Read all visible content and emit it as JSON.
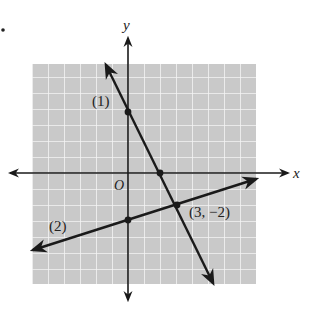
{
  "figure": {
    "marker": ".",
    "axes": {
      "x_label": "x",
      "y_label": "y",
      "origin_label": "O"
    },
    "grid": {
      "x_min": -6,
      "x_max": 8,
      "y_min": -7,
      "y_max": 7,
      "unit_px": 16,
      "origin_px": [
        128,
        173
      ],
      "bg_color": "#c9c9c9",
      "line_color": "#f2f2f2"
    },
    "lines": [
      {
        "label": "(1)",
        "equation": "y = -2x + 4",
        "slope": -2,
        "intercept": 4,
        "from": [
          -1.4,
          6.8
        ],
        "to": [
          5.3,
          -6.6
        ]
      },
      {
        "label": "(2)",
        "equation": "y = x/3 - 3",
        "slope": 0.3333,
        "intercept": -3,
        "from": [
          -5.9,
          -4.97
        ],
        "to": [
          7.9,
          -0.37
        ]
      }
    ],
    "points": [
      {
        "name": "y-intercept-line-1",
        "x": 0,
        "y": 4
      },
      {
        "name": "x-intercept-line-1",
        "x": 2,
        "y": 0
      },
      {
        "name": "y-intercept-line-2",
        "x": 0,
        "y": -3
      },
      {
        "name": "intersection",
        "x": 3,
        "y": -2,
        "label": "(3, −2)"
      }
    ],
    "colors": {
      "ink": "#1a1a1a"
    }
  }
}
